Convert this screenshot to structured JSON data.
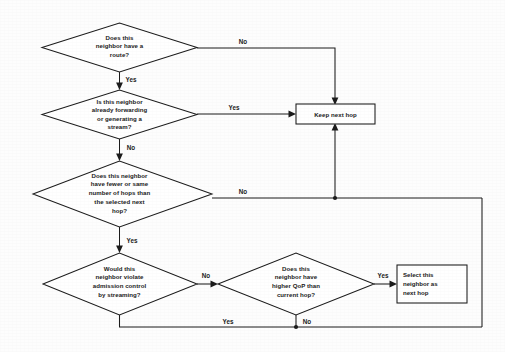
{
  "diagram": {
    "type": "flowchart",
    "stroke_color": "#1c1c1c",
    "fill_color": "#ffffff",
    "background_color": "#fdfdfd"
  },
  "nodes": [
    {
      "id": "d1",
      "shape": "decision",
      "lines": [
        "Does this",
        "neighbor have a",
        "route?"
      ]
    },
    {
      "id": "d2",
      "shape": "decision",
      "lines": [
        "Is this neighbor",
        "already forwarding",
        "or generating  a",
        "stream?"
      ]
    },
    {
      "id": "d3",
      "shape": "decision",
      "lines": [
        "Does this neighbor",
        "have fewer or same",
        "number of hops than",
        "the selected next",
        "hop?"
      ]
    },
    {
      "id": "d4",
      "shape": "decision",
      "lines": [
        "Would this",
        "neighbor violate",
        "admission control",
        "by streaming?"
      ]
    },
    {
      "id": "d5",
      "shape": "decision",
      "lines": [
        "Does this",
        "neighbor have",
        "higher QoP than",
        "current hop?"
      ]
    },
    {
      "id": "p1",
      "shape": "process",
      "lines": [
        "Keep next hop"
      ]
    },
    {
      "id": "p2",
      "shape": "process",
      "lines": [
        "Select this",
        "neighbor as",
        "next hop"
      ]
    }
  ],
  "edge_labels": {
    "d1_no": "No",
    "d1_yes": "Yes",
    "d2_yes": "Yes",
    "d2_no": "No",
    "d3_no": "No",
    "d3_yes": "Yes",
    "d4_no": "No",
    "d4_yes": "Yes",
    "d5_yes": "Yes",
    "d5_no": "No"
  }
}
